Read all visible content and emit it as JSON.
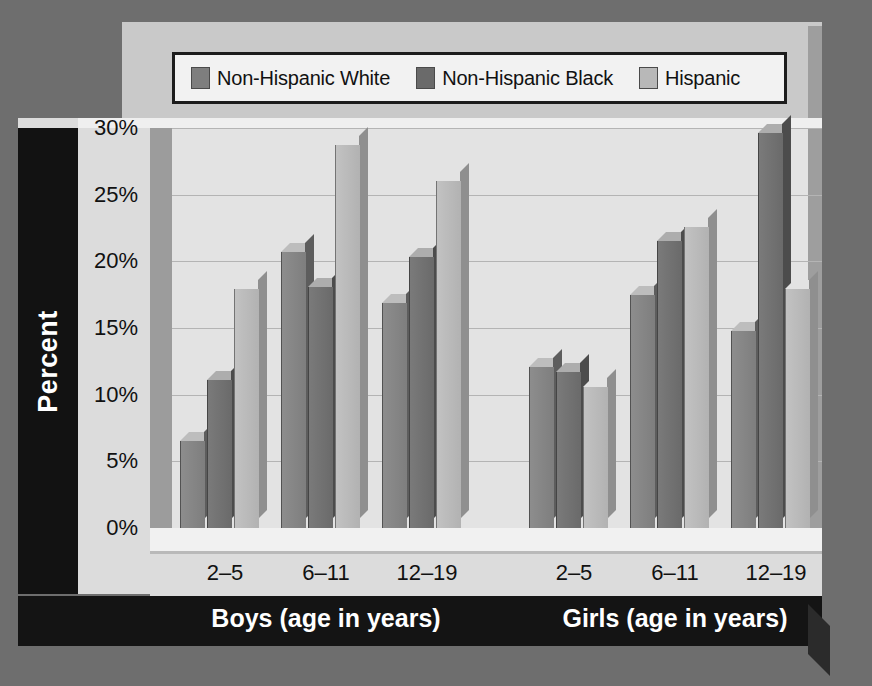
{
  "chart_data": {
    "type": "bar",
    "title": "",
    "xlabel": "",
    "ylabel": "Percent",
    "ylim": [
      0,
      30
    ],
    "ytick_labels": [
      "0%",
      "5%",
      "10%",
      "15%",
      "20%",
      "25%",
      "30%"
    ],
    "ytick_values": [
      0,
      5,
      10,
      15,
      20,
      25,
      30
    ],
    "grid": true,
    "legend_position": "top",
    "categories": [
      "2–5",
      "6–11",
      "12–19",
      "2–5",
      "6–11",
      "12–19"
    ],
    "group_labels": [
      "Boys (age in years)",
      "Girls (age in years)"
    ],
    "series": [
      {
        "name": "Non-Hispanic White",
        "color": "#7e7e7e",
        "values": [
          6.5,
          20.7,
          16.9,
          12.1,
          17.5,
          14.8
        ]
      },
      {
        "name": "Non-Hispanic Black",
        "color": "#6a6a6a",
        "values": [
          11.1,
          18.1,
          20.3,
          11.7,
          21.5,
          29.6
        ]
      },
      {
        "name": "Hispanic",
        "color": "#b8b8b8",
        "values": [
          17.9,
          28.7,
          26.0,
          10.6,
          22.6,
          17.9
        ]
      }
    ]
  },
  "legend": {
    "items": [
      {
        "label": "Non-Hispanic White",
        "swatch": "legend-swatch-white"
      },
      {
        "label": "Non-Hispanic Black",
        "swatch": "legend-swatch-black"
      },
      {
        "label": "Hispanic",
        "swatch": "legend-swatch-hispanic"
      }
    ]
  },
  "axis": {
    "y_title": "Percent"
  },
  "colors": {
    "page_background": "#6e6e6e",
    "plot_background": "#e3e3e3",
    "band_background": "#141414",
    "band_text": "#ffffff"
  }
}
